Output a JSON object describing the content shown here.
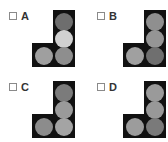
{
  "options": [
    {
      "label": "A",
      "circles": {
        "top": "#6e6e6e",
        "middle": "#d0d0d0",
        "bottom_right": "#8e8e8e",
        "bottom_left": "#9f9f9f"
      }
    },
    {
      "label": "B",
      "circles": {
        "top": "#8f8f8f",
        "middle": "#959595",
        "bottom_right": "#6f6f6f",
        "bottom_left": "#a0a0a0"
      }
    },
    {
      "label": "C",
      "circles": {
        "top": "#7b7b7b",
        "middle": "#9a9a9a",
        "bottom_right": "#a4a4a4",
        "bottom_left": "#8c8c8c"
      }
    },
    {
      "label": "D",
      "circles": {
        "top": "#9a9a9a",
        "middle": "#989898",
        "bottom_right": "#7a7a7a",
        "bottom_left": "#9c9c9c"
      }
    }
  ]
}
